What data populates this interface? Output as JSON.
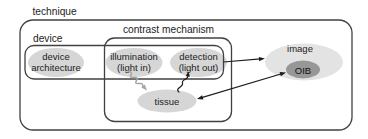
{
  "figure": {
    "labels": {
      "technique": "technique",
      "device": "device",
      "contrast_mechanism": "contrast mechanism"
    },
    "nodes": {
      "device_architecture": {
        "line1": "device",
        "line2": "architecture"
      },
      "illumination": {
        "line1": "illumination",
        "line2": "(light in)"
      },
      "detection": {
        "line1": "detection",
        "line2": "(light out)"
      },
      "tissue": {
        "label": "tissue"
      },
      "image": {
        "label": "image"
      },
      "oib": {
        "label": "OIB"
      }
    },
    "colors": {
      "node_fill": "#d6d6d6",
      "image_fill": "#e3e3e3",
      "oib_fill": "#979797",
      "box_stroke": "#414141",
      "arrow": "#1c1c1c",
      "wave_gray": "#a6a6a6",
      "text": "#1c1c1c",
      "background": "#ffffff"
    }
  }
}
